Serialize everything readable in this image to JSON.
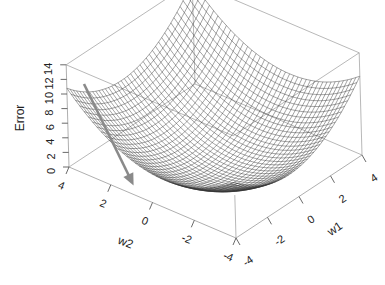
{
  "chart_data": {
    "type": "surface3d",
    "title": "",
    "surface_function": "Error = 0.33*((w1+0.6)^2 + (w2+0.6)^2)",
    "x_axis": {
      "label": "w1",
      "ticks": [
        "-4",
        "-2",
        "0",
        "2",
        "4"
      ],
      "range": [
        -4,
        4
      ]
    },
    "y_axis": {
      "label": "w2",
      "ticks": [
        "4",
        "2",
        "0",
        "-2",
        "-4"
      ],
      "range": [
        -4,
        4
      ]
    },
    "z_axis": {
      "label": "Error",
      "ticks": [
        "0",
        "2",
        "4",
        "6",
        "8",
        "10",
        "12",
        "14"
      ],
      "range": [
        0,
        14
      ]
    },
    "grid": {
      "mesh_lines": 40,
      "wireframe": true,
      "box": true
    },
    "annotation": {
      "type": "arrow",
      "description": "gradient descent direction arrow",
      "color": "#8a8a8a"
    },
    "colors": {
      "mesh": "#333333",
      "box": "#9a9a9a",
      "arrow": "#8a8a8a",
      "text": "#222222"
    }
  },
  "labels": {
    "z_axis_label": "Error",
    "x_axis_label": "w1",
    "y_axis_label": "w2"
  }
}
